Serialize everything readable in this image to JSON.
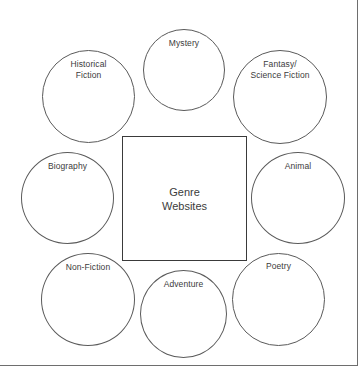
{
  "diagram": {
    "center": {
      "label": "Genre\nWebsites",
      "shape": "square"
    },
    "nodes": [
      {
        "id": "mystery",
        "label": "Mystery"
      },
      {
        "id": "historical",
        "label": "Historical\nFiction"
      },
      {
        "id": "fantasy",
        "label": "Fantasy/\nScience Fiction"
      },
      {
        "id": "biography",
        "label": "Biography"
      },
      {
        "id": "animal",
        "label": "Animal"
      },
      {
        "id": "nonfiction",
        "label": "Non-Fiction"
      },
      {
        "id": "adventure",
        "label": "Adventure"
      },
      {
        "id": "poetry",
        "label": "Poetry"
      }
    ],
    "colors": {
      "background": "#ffffff",
      "circle_stroke": "#5a5a5a",
      "square_stroke": "#3a3a3a",
      "page_border": "#6e6e6e",
      "text": "#3b3b3b"
    }
  }
}
